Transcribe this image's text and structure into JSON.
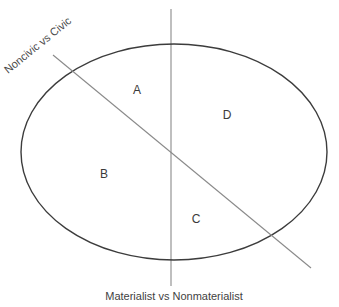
{
  "diagram": {
    "type": "two-axis-typology",
    "background_color": "#ffffff",
    "ellipse": {
      "name": "value-space-ellipse",
      "stroke_color": "#3c3c3c",
      "stroke_width": 1.4,
      "fill": "none",
      "center_x": 174,
      "center_y": 152,
      "radius_x": 153,
      "radius_y": 108
    },
    "axes": {
      "vertical": {
        "caption_left": "Materialist",
        "caption_middle": "vs",
        "caption_right": "Nonmaterialist",
        "caption_full": "Materialist  vs  Nonmaterialist",
        "stroke_color": "#8a8a8a",
        "stroke_width": 1.1,
        "x": 171,
        "y_top": 9,
        "y_bottom": 286,
        "caption_x": 174,
        "caption_y": 300
      },
      "diagonal": {
        "caption": "Noncivic vs Civic",
        "stroke_color": "#8a8a8a",
        "stroke_width": 1.1,
        "x1": 53,
        "y1": 55,
        "x2": 311,
        "y2": 268,
        "caption_x": 8,
        "caption_y": 74,
        "caption_rotation": -39
      }
    },
    "regions": [
      {
        "id": "A",
        "label": "A",
        "x": 137,
        "y": 91,
        "quadrant": "upper-left-of-diagonal, materialist side"
      },
      {
        "id": "B",
        "label": "B",
        "x": 104,
        "y": 175,
        "quadrant": "lower-left, materialist side"
      },
      {
        "id": "C",
        "label": "C",
        "x": 196,
        "y": 220,
        "quadrant": "lower-right, nonmaterialist side"
      },
      {
        "id": "D",
        "label": "D",
        "x": 227,
        "y": 116,
        "quadrant": "upper-right, nonmaterialist side"
      }
    ]
  }
}
